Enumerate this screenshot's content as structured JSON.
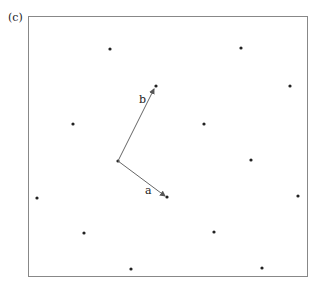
{
  "panel_label": "(c)",
  "frame": {
    "x": 28,
    "y": 16,
    "w": 279,
    "h": 260,
    "color": "#888888"
  },
  "lattice_points": [
    [
      110,
      49
    ],
    [
      241,
      48
    ],
    [
      156,
      86
    ],
    [
      290,
      86
    ],
    [
      73,
      124
    ],
    [
      204,
      124
    ],
    [
      118,
      161
    ],
    [
      251,
      160
    ],
    [
      37,
      198
    ],
    [
      167,
      197
    ],
    [
      298,
      196
    ],
    [
      84,
      233
    ],
    [
      214,
      232
    ],
    [
      131,
      269
    ],
    [
      262,
      268
    ]
  ],
  "origin": [
    118,
    161
  ],
  "vectors": [
    {
      "name": "a",
      "label": "a",
      "to": [
        165,
        196
      ],
      "label_pos": [
        145,
        194
      ]
    },
    {
      "name": "b",
      "label": "b",
      "to": [
        154,
        89
      ],
      "label_pos": [
        139,
        103
      ]
    }
  ],
  "point_color": "#222222",
  "vector_color": "#666666"
}
